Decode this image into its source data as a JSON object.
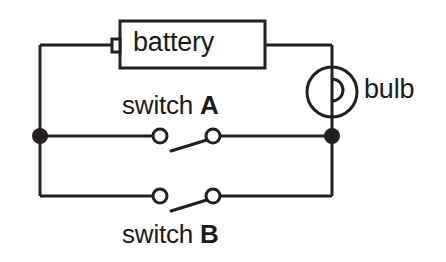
{
  "diagram": {
    "background_color": "#ffffff",
    "line_color": "#231f20",
    "text_color": "#1a1a1a",
    "stroke_width": 3
  },
  "components": {
    "battery": {
      "label": "battery",
      "shape": "rectangle-with-terminal-nub",
      "box": {
        "x": 120,
        "y": 21,
        "width": 145,
        "height": 47
      },
      "terminal_nub": {
        "x": 112,
        "y": 39,
        "width": 8,
        "height": 13
      }
    },
    "bulb": {
      "label": "bulb",
      "shape": "circle-with-hook-filament",
      "center": {
        "x": 332,
        "y": 92
      },
      "radius": 25
    },
    "switch_a": {
      "word": "switch",
      "id": "A",
      "state": "open",
      "terminal_left": {
        "x": 160,
        "y": 136
      },
      "terminal_right": {
        "x": 213,
        "y": 136
      },
      "terminal_radius": 7,
      "lever_end": {
        "x": 171,
        "y": 151
      }
    },
    "switch_b": {
      "word": "switch",
      "id": "B",
      "state": "open",
      "terminal_left": {
        "x": 160,
        "y": 196
      },
      "terminal_right": {
        "x": 213,
        "y": 196
      },
      "terminal_radius": 7,
      "lever_end": {
        "x": 171,
        "y": 211
      }
    },
    "junction_left": {
      "x": 40,
      "y": 136,
      "radius": 8,
      "filled": true
    },
    "junction_right": {
      "x": 332,
      "y": 136,
      "radius": 8,
      "filled": true
    }
  },
  "wires": {
    "outer_loop": {
      "left_x": 40,
      "right_x": 332,
      "top_y": 45,
      "bottom_y": 196,
      "middle_y": 136
    }
  }
}
